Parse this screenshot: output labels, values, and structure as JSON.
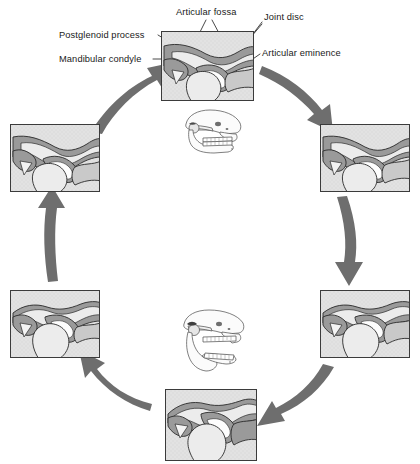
{
  "figure": {
    "title_text": "",
    "colors": {
      "panel_background": "#e2e2e2",
      "panel_border": "#3b3b3b",
      "bone_fill": "#e8e8e8",
      "disc_fill": "#9a9a9a",
      "cartilage_fill": "#c9c9c9",
      "arrow_fill": "#6e6e6e",
      "outline": "#2a2a2a",
      "label_text": "#1a1a1a",
      "leader_line": "#1a1a1a"
    }
  },
  "labels": [
    {
      "id": "articular-fossa",
      "text": "Articular fossa"
    },
    {
      "id": "joint-disc",
      "text": "Joint disc"
    },
    {
      "id": "postglenoid-process",
      "text": "Postglenoid process"
    },
    {
      "id": "articular-eminence",
      "text": "Articular eminence"
    },
    {
      "id": "mandibular-condyle",
      "text": "Mandibular condyle"
    }
  ],
  "panels": [
    {
      "id": "panel-top",
      "position": "top-center",
      "stage": "1",
      "caption": ""
    },
    {
      "id": "panel-right-upper",
      "position": "right-upper",
      "stage": "2",
      "caption": ""
    },
    {
      "id": "panel-right-lower",
      "position": "right-lower",
      "stage": "3",
      "caption": ""
    },
    {
      "id": "panel-bottom",
      "position": "bottom-center",
      "stage": "4",
      "caption": ""
    },
    {
      "id": "panel-left-lower",
      "position": "left-lower",
      "stage": "5",
      "caption": ""
    },
    {
      "id": "panel-left-upper",
      "position": "left-upper",
      "stage": "6",
      "caption": ""
    }
  ],
  "skulls": [
    {
      "id": "skull-mouth-closed",
      "text": "",
      "state": "mouth closed"
    },
    {
      "id": "skull-mouth-open",
      "text": "",
      "state": "mouth open"
    }
  ],
  "arrows": [
    {
      "id": "arrow-top-to-right",
      "direction": "down-right"
    },
    {
      "id": "arrow-right-upper-to-lower",
      "direction": "down"
    },
    {
      "id": "arrow-right-lower-to-bottom",
      "direction": "down-left"
    },
    {
      "id": "arrow-bottom-to-left-lower",
      "direction": "up-left"
    },
    {
      "id": "arrow-left-lower-to-upper",
      "direction": "up"
    },
    {
      "id": "arrow-left-upper-to-top",
      "direction": "up-right"
    }
  ]
}
